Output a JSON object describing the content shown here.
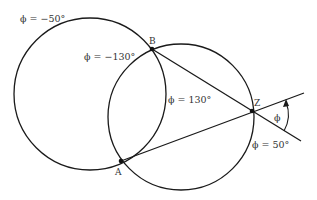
{
  "diagram": {
    "labels": {
      "left_circle": "ϕ = −50°",
      "inner_left_arc": "ϕ = −130°",
      "inner_right_arc": "ϕ = 130°",
      "right_circle": "ϕ = 50°",
      "angle": "ϕ"
    },
    "points": {
      "A": "A",
      "B": "B",
      "Z": "Z"
    },
    "colors": {
      "stroke": "#1a1a1a",
      "text": "#333333"
    }
  }
}
